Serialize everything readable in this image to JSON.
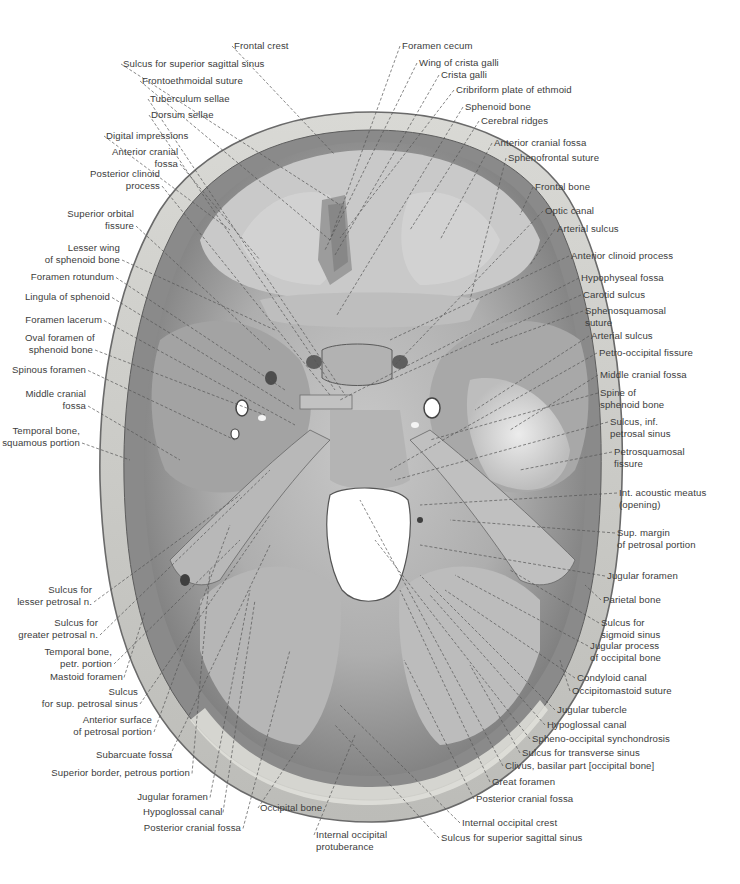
{
  "figure": {
    "colors": {
      "background": "#ffffff",
      "bone_outer": "#cfcfcf",
      "bone_diploe": "#e4e4e0",
      "fossa_dark": "#8e8e8e",
      "fossa_mid": "#a9a9a9",
      "fossa_light": "#d6d6d6",
      "foramen": "#ffffff",
      "leader": "#555555",
      "text": "#3c3c3c"
    }
  },
  "labels": {
    "top": [
      {
        "id": "frontal-crest",
        "lines": [
          "Frontal crest"
        ],
        "x": 234,
        "y": 40,
        "align": "l",
        "tx": 335,
        "ty": 155
      },
      {
        "id": "sulcus-sup-sagittal-sinus-top",
        "lines": [
          "Sulcus for superior sagittal sinus"
        ],
        "x": 123,
        "y": 58,
        "align": "l",
        "tx": 340,
        "ty": 205
      },
      {
        "id": "frontoethmoidal-suture",
        "lines": [
          "Frontoethmoidal suture"
        ],
        "x": 142,
        "y": 75,
        "align": "l",
        "tx": 330,
        "ty": 240
      },
      {
        "id": "tuberculum-sellae",
        "lines": [
          "Tuberculum sellae"
        ],
        "x": 150,
        "y": 93,
        "align": "l",
        "tx": 345,
        "ty": 395
      },
      {
        "id": "dorsum-sellae",
        "lines": [
          "Dorsum sellae"
        ],
        "x": 151,
        "y": 109,
        "align": "l",
        "tx": 335,
        "ty": 390
      },
      {
        "id": "digital-impressions",
        "lines": [
          "Digital impressions"
        ],
        "x": 106,
        "y": 130,
        "align": "l",
        "tx": 230,
        "ty": 230
      },
      {
        "id": "foramen-cecum",
        "lines": [
          "Foramen cecum"
        ],
        "x": 402,
        "y": 40,
        "align": "l",
        "tx": 330,
        "ty": 240
      },
      {
        "id": "wing-of-crista-galli",
        "lines": [
          "Wing of crista galli"
        ],
        "x": 419,
        "y": 57,
        "align": "l",
        "tx": 325,
        "ty": 250
      },
      {
        "id": "crista-galli",
        "lines": [
          "Crista galli"
        ],
        "x": 441,
        "y": 69,
        "align": "l",
        "tx": 335,
        "ty": 255
      },
      {
        "id": "cribriform-plate",
        "lines": [
          "Cribriform plate of ethmoid"
        ],
        "x": 456,
        "y": 84,
        "align": "l",
        "tx": 340,
        "ty": 238
      },
      {
        "id": "sphenoid-bone",
        "lines": [
          "Sphenoid bone"
        ],
        "x": 465,
        "y": 101,
        "align": "l",
        "tx": 337,
        "ty": 315
      },
      {
        "id": "cerebral-ridges",
        "lines": [
          "Cerebral ridges"
        ],
        "x": 481,
        "y": 115,
        "align": "l",
        "tx": 410,
        "ty": 230
      }
    ],
    "left": [
      {
        "id": "anterior-cranial-fossa-left",
        "lines": [
          "Anterior cranial",
          "fossa"
        ],
        "x": 112,
        "y": 146,
        "align": "r",
        "w": 66,
        "tx": 260,
        "ty": 260
      },
      {
        "id": "posterior-clinoid-process",
        "lines": [
          "Posterior clinoid",
          "process"
        ],
        "x": 90,
        "y": 168,
        "align": "r",
        "w": 70,
        "tx": 330,
        "ty": 395
      },
      {
        "id": "superior-orbital-fissure",
        "lines": [
          "Superior orbital",
          "fissure"
        ],
        "x": 64,
        "y": 208,
        "align": "r",
        "w": 70,
        "tx": 270,
        "ty": 350
      },
      {
        "id": "lesser-wing-sphenoid",
        "lines": [
          "Lesser wing",
          "of sphenoid bone"
        ],
        "x": 42,
        "y": 242,
        "align": "r",
        "w": 78,
        "tx": 275,
        "ty": 330
      },
      {
        "id": "foramen-rotundum",
        "lines": [
          "Foramen rotundum"
        ],
        "x": 30,
        "y": 271,
        "align": "r",
        "w": 84,
        "tx": 285,
        "ty": 390
      },
      {
        "id": "lingula-of-sphenoid",
        "lines": [
          "Lingula of sphenoid"
        ],
        "x": 22,
        "y": 291,
        "align": "r",
        "w": 88,
        "tx": 295,
        "ty": 410
      },
      {
        "id": "foramen-lacerum",
        "lines": [
          "Foramen lacerum"
        ],
        "x": 24,
        "y": 314,
        "align": "r",
        "w": 78,
        "tx": 295,
        "ty": 425
      },
      {
        "id": "oval-foramen",
        "lines": [
          "Oval foramen of",
          "sphenoid bone"
        ],
        "x": 25,
        "y": 332,
        "align": "r",
        "w": 68,
        "tx": 265,
        "ty": 415
      },
      {
        "id": "spinous-foramen",
        "lines": [
          "Spinous foramen"
        ],
        "x": 10,
        "y": 364,
        "align": "r",
        "w": 76,
        "tx": 235,
        "ty": 440
      },
      {
        "id": "middle-cranial-fossa-left",
        "lines": [
          "Middle cranial",
          "fossa"
        ],
        "x": 22,
        "y": 388,
        "align": "r",
        "w": 64,
        "tx": 180,
        "ty": 460
      },
      {
        "id": "temporal-bone-squamous",
        "lines": [
          "Temporal bone,",
          "squamous portion"
        ],
        "x": 0,
        "y": 425,
        "align": "r",
        "w": 80,
        "tx": 130,
        "ty": 460
      }
    ],
    "right": [
      {
        "id": "anterior-cranial-fossa-right",
        "lines": [
          "Anterior cranial fossa"
        ],
        "x": 494,
        "y": 137,
        "align": "l",
        "tx": 440,
        "ty": 240
      },
      {
        "id": "sphenofrontal-suture",
        "lines": [
          "Sphenofrontal suture"
        ],
        "x": 508,
        "y": 152,
        "align": "l",
        "tx": 470,
        "ty": 300
      },
      {
        "id": "frontal-bone",
        "lines": [
          "Frontal bone"
        ],
        "x": 535,
        "y": 181,
        "align": "l",
        "tx": 520,
        "ty": 215
      },
      {
        "id": "optic-canal",
        "lines": [
          "Optic canal"
        ],
        "x": 545,
        "y": 205,
        "align": "l",
        "tx": 395,
        "ty": 365
      },
      {
        "id": "arterial-sulcus-top",
        "lines": [
          "Arterial sulcus"
        ],
        "x": 557,
        "y": 223,
        "align": "l",
        "tx": 530,
        "ty": 265
      },
      {
        "id": "anterior-clinoid-process",
        "lines": [
          "Anterior clinoid process"
        ],
        "x": 571,
        "y": 250,
        "align": "l",
        "tx": 390,
        "ty": 340
      },
      {
        "id": "hypophyseal-fossa",
        "lines": [
          "Hypophyseal fossa"
        ],
        "x": 581,
        "y": 272,
        "align": "l",
        "tx": 340,
        "ty": 400
      },
      {
        "id": "carotid-sulcus",
        "lines": [
          "Carotid sulcus"
        ],
        "x": 583,
        "y": 289,
        "align": "l",
        "tx": 390,
        "ty": 380
      },
      {
        "id": "sphenosquamosal-suture",
        "lines": [
          "Sphenosquamosal",
          "suture"
        ],
        "x": 585,
        "y": 305,
        "align": "l",
        "tx": 490,
        "ty": 345
      },
      {
        "id": "arterial-sulcus-mid",
        "lines": [
          "Arterial sulcus"
        ],
        "x": 591,
        "y": 330,
        "align": "l",
        "tx": 475,
        "ty": 410
      },
      {
        "id": "petro-occipital-fissure",
        "lines": [
          "Petro-occipital fissure"
        ],
        "x": 599,
        "y": 347,
        "align": "l",
        "tx": 390,
        "ty": 470
      },
      {
        "id": "middle-cranial-fossa-right",
        "lines": [
          "Middle cranial fossa"
        ],
        "x": 600,
        "y": 369,
        "align": "l",
        "tx": 510,
        "ty": 430
      },
      {
        "id": "spine-of-sphenoid",
        "lines": [
          "Spine of",
          "sphenoid bone"
        ],
        "x": 600,
        "y": 387,
        "align": "l",
        "tx": 430,
        "ty": 440
      },
      {
        "id": "sulcus-inf-petrosal-sinus",
        "lines": [
          "Sulcus, inf.",
          "petrosal sinus"
        ],
        "x": 610,
        "y": 416,
        "align": "l",
        "tx": 395,
        "ty": 480
      },
      {
        "id": "petrosquamosal-fissure",
        "lines": [
          "Petrosquamosal",
          "fissure"
        ],
        "x": 614,
        "y": 446,
        "align": "l",
        "tx": 520,
        "ty": 470
      },
      {
        "id": "int-acoustic-meatus",
        "lines": [
          "Int. acoustic meatus",
          "(opening)"
        ],
        "x": 619,
        "y": 487,
        "align": "l",
        "tx": 420,
        "ty": 505
      },
      {
        "id": "sup-margin-petrosal",
        "lines": [
          "Sup. margin",
          "of petrosal portion"
        ],
        "x": 617,
        "y": 527,
        "align": "l",
        "tx": 450,
        "ty": 520
      },
      {
        "id": "jugular-foramen-right",
        "lines": [
          "Jugular foramen"
        ],
        "x": 607,
        "y": 570,
        "align": "l",
        "tx": 420,
        "ty": 545
      },
      {
        "id": "parietal-bone",
        "lines": [
          "Parietal bone"
        ],
        "x": 603,
        "y": 594,
        "align": "l",
        "tx": 585,
        "ty": 585
      },
      {
        "id": "sulcus-sigmoid-sinus",
        "lines": [
          "Sulcus for",
          "sigmoid sinus"
        ],
        "x": 601,
        "y": 617,
        "align": "l",
        "tx": 510,
        "ty": 570
      },
      {
        "id": "jugular-process-occipital",
        "lines": [
          "Jugular process",
          "of occipital bone"
        ],
        "x": 590,
        "y": 640,
        "align": "l",
        "tx": 455,
        "ty": 575
      },
      {
        "id": "condyloid-canal",
        "lines": [
          "Condyloid canal"
        ],
        "x": 577,
        "y": 672,
        "align": "l",
        "tx": 445,
        "ty": 590
      },
      {
        "id": "occipitomastoid-suture",
        "lines": [
          "Occipitomastoid suture"
        ],
        "x": 572,
        "y": 685,
        "align": "l",
        "tx": 560,
        "ty": 660
      }
    ],
    "bottom_right": [
      {
        "id": "jugular-tubercle",
        "lines": [
          "Jugular tubercle"
        ],
        "x": 557,
        "y": 704,
        "align": "l",
        "tx": 420,
        "ty": 575
      },
      {
        "id": "hypoglossal-canal-right",
        "lines": [
          "Hypoglossal canal"
        ],
        "x": 547,
        "y": 719,
        "align": "l",
        "tx": 430,
        "ty": 595
      },
      {
        "id": "spheno-occipital-synchondrosis",
        "lines": [
          "Spheno-occipital synchondrosis"
        ],
        "x": 532,
        "y": 733,
        "align": "l",
        "tx": 375,
        "ty": 540
      },
      {
        "id": "sulcus-transverse-sinus",
        "lines": [
          "Sulcus for transverse sinus"
        ],
        "x": 522,
        "y": 747,
        "align": "l",
        "tx": 470,
        "ty": 665
      },
      {
        "id": "clivus",
        "lines": [
          "Clivus, basilar part [occipital bone]"
        ],
        "x": 505,
        "y": 760,
        "align": "l",
        "tx": 360,
        "ty": 500
      },
      {
        "id": "great-foramen",
        "lines": [
          "Great foramen"
        ],
        "x": 492,
        "y": 776,
        "align": "l",
        "tx": 400,
        "ty": 590
      },
      {
        "id": "posterior-cranial-fossa-right",
        "lines": [
          "Posterior cranial fossa"
        ],
        "x": 476,
        "y": 793,
        "align": "l",
        "tx": 404,
        "ty": 660
      },
      {
        "id": "internal-occipital-crest",
        "lines": [
          "Internal occipital crest"
        ],
        "x": 462,
        "y": 817,
        "align": "l",
        "tx": 340,
        "ty": 705
      },
      {
        "id": "sulcus-sup-sagittal-sinus-bottom",
        "lines": [
          "Sulcus for superior sagittal sinus"
        ],
        "x": 441,
        "y": 832,
        "align": "l",
        "tx": 335,
        "ty": 725
      }
    ],
    "bottom_left": [
      {
        "id": "sulcus-lesser-petrosal",
        "lines": [
          "Sulcus for",
          "lesser petrosal n."
        ],
        "x": 14,
        "y": 584,
        "align": "r",
        "w": 78,
        "tx": 240,
        "ty": 495
      },
      {
        "id": "sulcus-greater-petrosal",
        "lines": [
          "Sulcus for",
          "greater petrosal n."
        ],
        "x": 18,
        "y": 617,
        "align": "r",
        "w": 80,
        "tx": 270,
        "ty": 470
      },
      {
        "id": "temporal-bone-petr",
        "lines": [
          "Temporal bone,",
          "petr. portion"
        ],
        "x": 44,
        "y": 646,
        "align": "r",
        "w": 68,
        "tx": 240,
        "ty": 540
      },
      {
        "id": "mastoid-foramen",
        "lines": [
          "Mastoid foramen"
        ],
        "x": 50,
        "y": 671,
        "align": "r",
        "w": 72,
        "tx": 145,
        "ty": 612
      },
      {
        "id": "sulcus-sup-petrosal",
        "lines": [
          "Sulcus",
          "for sup. petrosal sinus"
        ],
        "x": 40,
        "y": 686,
        "align": "r",
        "w": 98,
        "tx": 270,
        "ty": 515
      },
      {
        "id": "anterior-surface-petrosal",
        "lines": [
          "Anterior surface",
          "of petrosal portion"
        ],
        "x": 72,
        "y": 714,
        "align": "r",
        "w": 80,
        "tx": 230,
        "ty": 525
      },
      {
        "id": "subarcuate-fossa",
        "lines": [
          "Subarcuate fossa"
        ],
        "x": 96,
        "y": 749,
        "align": "r",
        "w": 72,
        "tx": 270,
        "ty": 545
      },
      {
        "id": "superior-border-petrous",
        "lines": [
          "Superior border, petrous portion"
        ],
        "x": 48,
        "y": 767,
        "align": "r",
        "w": 142,
        "tx": 210,
        "ty": 570
      },
      {
        "id": "jugular-foramen-left",
        "lines": [
          "Jugular foramen"
        ],
        "x": 136,
        "y": 791,
        "align": "r",
        "w": 72,
        "tx": 250,
        "ty": 590
      },
      {
        "id": "hypoglossal-canal-left",
        "lines": [
          "Hypoglossal canal"
        ],
        "x": 143,
        "y": 806,
        "align": "r",
        "w": 78,
        "tx": 255,
        "ty": 600
      },
      {
        "id": "posterior-cranial-fossa-left",
        "lines": [
          "Posterior cranial fossa"
        ],
        "x": 143,
        "y": 822,
        "align": "r",
        "w": 98,
        "tx": 290,
        "ty": 650
      },
      {
        "id": "occipital-bone",
        "lines": [
          "Occipital bone"
        ],
        "x": 260,
        "y": 802,
        "align": "l",
        "tx": 300,
        "ty": 745
      },
      {
        "id": "internal-occipital-protuberance",
        "lines": [
          "Internal occipital",
          "protuberance"
        ],
        "x": 316,
        "y": 829,
        "align": "l",
        "tx": 355,
        "ty": 735
      }
    ]
  }
}
